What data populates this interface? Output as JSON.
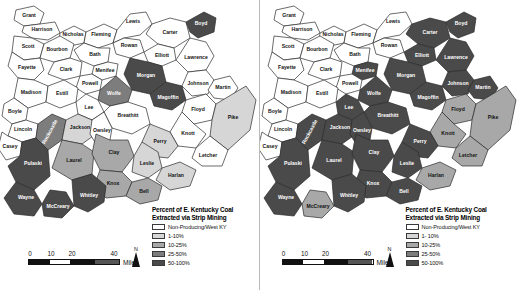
{
  "figure": {
    "type": "choropleth-map-pair",
    "panels": [
      {
        "id": "left",
        "legend": {
          "title_line1": "Percent of E. Kentucky Coal",
          "title_line2": "Extracted via Strip Mining",
          "classes": [
            {
              "label": "Non-Producing/West KY",
              "color": "#ffffff"
            },
            {
              "label": "1-10%",
              "color": "#d6d6d6"
            },
            {
              "label": "10-25%",
              "color": "#a8a8a8"
            },
            {
              "label": "25-50%",
              "color": "#7d7d7d"
            },
            {
              "label": "50-100%",
              "color": "#4a4a4a"
            }
          ]
        },
        "scalebar": {
          "ticks": [
            "0",
            "10",
            "20",
            "40"
          ],
          "units": "Miles"
        },
        "north": {
          "label": "N"
        },
        "counties": [
          {
            "name": "Grant",
            "cls": 0
          },
          {
            "name": "Harrison",
            "cls": 0
          },
          {
            "name": "Nicholas",
            "cls": 0
          },
          {
            "name": "Fleming",
            "cls": 0
          },
          {
            "name": "Lewis",
            "cls": 0
          },
          {
            "name": "Carter",
            "cls": 0
          },
          {
            "name": "Boyd",
            "cls": 4
          },
          {
            "name": "Scott",
            "cls": 0
          },
          {
            "name": "Bourbon",
            "cls": 0
          },
          {
            "name": "Bath",
            "cls": 0
          },
          {
            "name": "Rowan",
            "cls": 0
          },
          {
            "name": "Elliott",
            "cls": 0
          },
          {
            "name": "Lawrence",
            "cls": 0
          },
          {
            "name": "Fayette",
            "cls": 0
          },
          {
            "name": "Clark",
            "cls": 0
          },
          {
            "name": "Menifee",
            "cls": 0
          },
          {
            "name": "Morgan",
            "cls": 4
          },
          {
            "name": "Johnson",
            "cls": 0
          },
          {
            "name": "Martin",
            "cls": 0
          },
          {
            "name": "Powell",
            "cls": 0
          },
          {
            "name": "Wolfe",
            "cls": 3
          },
          {
            "name": "Magoffin",
            "cls": 4
          },
          {
            "name": "Floyd",
            "cls": 0
          },
          {
            "name": "Pike",
            "cls": 1
          },
          {
            "name": "Madison",
            "cls": 0
          },
          {
            "name": "Estill",
            "cls": 0
          },
          {
            "name": "Lee",
            "cls": 0
          },
          {
            "name": "Breathitt",
            "cls": 0
          },
          {
            "name": "Knott",
            "cls": 0
          },
          {
            "name": "Boyle",
            "cls": 0
          },
          {
            "name": "Lincoln",
            "cls": 0
          },
          {
            "name": "Rockcastle",
            "cls": 3
          },
          {
            "name": "Jackson",
            "cls": 1
          },
          {
            "name": "Owsley",
            "cls": 0
          },
          {
            "name": "Perry",
            "cls": 1
          },
          {
            "name": "Letcher",
            "cls": 0
          },
          {
            "name": "Casey",
            "cls": 0
          },
          {
            "name": "Pulaski",
            "cls": 4
          },
          {
            "name": "Laurel",
            "cls": 2
          },
          {
            "name": "Clay",
            "cls": 2
          },
          {
            "name": "Leslie",
            "cls": 1
          },
          {
            "name": "Harlan",
            "cls": 1
          },
          {
            "name": "Knox",
            "cls": 2
          },
          {
            "name": "Bell",
            "cls": 2
          },
          {
            "name": "Wayne",
            "cls": 4
          },
          {
            "name": "McCreary",
            "cls": 4
          },
          {
            "name": "Whitley",
            "cls": 4
          }
        ]
      },
      {
        "id": "right",
        "legend": {
          "title_line1": "Percent of E. Kentucky Coal",
          "title_line2": "Extracted via Strip Mining",
          "classes": [
            {
              "label": "Non-Producing/West KY",
              "color": "#ffffff"
            },
            {
              "label": "1- 10%",
              "color": "#d6d6d6"
            },
            {
              "label": "10-25%",
              "color": "#a8a8a8"
            },
            {
              "label": "25-50%",
              "color": "#7d7d7d"
            },
            {
              "label": "50-100%",
              "color": "#4a4a4a"
            }
          ]
        },
        "scalebar": {
          "ticks": [
            "0",
            "10",
            "20",
            "40"
          ],
          "units": "Miles"
        },
        "north": {
          "label": "N"
        },
        "counties": [
          {
            "name": "Grant",
            "cls": 0
          },
          {
            "name": "Harrison",
            "cls": 0
          },
          {
            "name": "Nicholas",
            "cls": 0
          },
          {
            "name": "Fleming",
            "cls": 0
          },
          {
            "name": "Lewis",
            "cls": 0
          },
          {
            "name": "Carter",
            "cls": 4
          },
          {
            "name": "Boyd",
            "cls": 4
          },
          {
            "name": "Scott",
            "cls": 0
          },
          {
            "name": "Bourbon",
            "cls": 0
          },
          {
            "name": "Bath",
            "cls": 0
          },
          {
            "name": "Rowan",
            "cls": 0
          },
          {
            "name": "Elliott",
            "cls": 4
          },
          {
            "name": "Lawrence",
            "cls": 4
          },
          {
            "name": "Fayette",
            "cls": 0
          },
          {
            "name": "Clark",
            "cls": 0
          },
          {
            "name": "Menifee",
            "cls": 4
          },
          {
            "name": "Morgan",
            "cls": 4
          },
          {
            "name": "Johnson",
            "cls": 4
          },
          {
            "name": "Martin",
            "cls": 4
          },
          {
            "name": "Powell",
            "cls": 0
          },
          {
            "name": "Wolfe",
            "cls": 4
          },
          {
            "name": "Magoffin",
            "cls": 4
          },
          {
            "name": "Floyd",
            "cls": 2
          },
          {
            "name": "Pike",
            "cls": 2
          },
          {
            "name": "Madison",
            "cls": 0
          },
          {
            "name": "Estill",
            "cls": 0
          },
          {
            "name": "Lee",
            "cls": 4
          },
          {
            "name": "Breathitt",
            "cls": 4
          },
          {
            "name": "Knott",
            "cls": 2
          },
          {
            "name": "Boyle",
            "cls": 0
          },
          {
            "name": "Lincoln",
            "cls": 0
          },
          {
            "name": "Rockcastle",
            "cls": 4
          },
          {
            "name": "Jackson",
            "cls": 4
          },
          {
            "name": "Owsley",
            "cls": 4
          },
          {
            "name": "Perry",
            "cls": 4
          },
          {
            "name": "Letcher",
            "cls": 2
          },
          {
            "name": "Casey",
            "cls": 0
          },
          {
            "name": "Pulaski",
            "cls": 4
          },
          {
            "name": "Laurel",
            "cls": 4
          },
          {
            "name": "Clay",
            "cls": 4
          },
          {
            "name": "Leslie",
            "cls": 4
          },
          {
            "name": "Harlan",
            "cls": 2
          },
          {
            "name": "Knox",
            "cls": 4
          },
          {
            "name": "Bell",
            "cls": 4
          },
          {
            "name": "Wayne",
            "cls": 4
          },
          {
            "name": "McCreary",
            "cls": 2
          },
          {
            "name": "Whitley",
            "cls": 4
          }
        ]
      }
    ]
  }
}
